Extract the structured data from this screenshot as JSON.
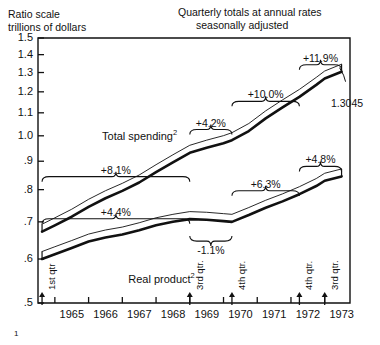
{
  "header": {
    "axis_caption_line1": "Ratio scale",
    "axis_caption_line2": "trillions of dollars",
    "title_line1": "Quarterly totals at annual rates",
    "title_line2": "seasonally adjusted"
  },
  "footnote_marker": "1",
  "chart_data": {
    "type": "line",
    "title": "Quarterly totals at annual rates seasonally adjusted",
    "subtitle": "",
    "xlabel": "",
    "ylabel": "Ratio scale trillions of dollars",
    "scale": "log",
    "grid": false,
    "legend_position": "inline-labels",
    "ylim": [
      0.5,
      1.5
    ],
    "ytick_labels": [
      "1.5",
      "1.4",
      "1.3",
      "1.2",
      "1.1",
      "1.0",
      ".9",
      ".8",
      ".7",
      ".6",
      ".5"
    ],
    "ytick_values": [
      1.5,
      1.4,
      1.3,
      1.2,
      1.1,
      1.0,
      0.9,
      0.8,
      0.7,
      0.6,
      0.5
    ],
    "xtick_labels": [
      "1965",
      "1966",
      "1967",
      "1968",
      "1969",
      "1970",
      "1971",
      "1972",
      "1973"
    ],
    "xtick_values": [
      1965,
      1966,
      1967,
      1968,
      1969,
      1970,
      1971,
      1972,
      1973
    ],
    "xlim": [
      1964.5,
      1973.75
    ],
    "quarter_markers": [
      {
        "label": "1st qtr",
        "x": 1964.62
      },
      {
        "label": "3rd qtr.",
        "x": 1969.0
      },
      {
        "label": "4th qtr.",
        "x": 1970.25
      },
      {
        "label": "4th qtr.",
        "x": 1972.25
      },
      {
        "label": "3rd qtr.",
        "x": 1973.0
      }
    ],
    "series": [
      {
        "name": "Total spending",
        "name_superscript": "2",
        "values": [
          {
            "x": 1964.62,
            "y": 0.672
          },
          {
            "x": 1965.0,
            "y": 0.69
          },
          {
            "x": 1965.5,
            "y": 0.715
          },
          {
            "x": 1966.0,
            "y": 0.745
          },
          {
            "x": 1966.5,
            "y": 0.772
          },
          {
            "x": 1967.0,
            "y": 0.796
          },
          {
            "x": 1967.5,
            "y": 0.824
          },
          {
            "x": 1968.0,
            "y": 0.86
          },
          {
            "x": 1968.5,
            "y": 0.896
          },
          {
            "x": 1969.0,
            "y": 0.932
          },
          {
            "x": 1969.5,
            "y": 0.952
          },
          {
            "x": 1970.0,
            "y": 0.97
          },
          {
            "x": 1970.25,
            "y": 0.982
          },
          {
            "x": 1970.75,
            "y": 1.02
          },
          {
            "x": 1971.25,
            "y": 1.075
          },
          {
            "x": 1971.75,
            "y": 1.125
          },
          {
            "x": 1972.25,
            "y": 1.175
          },
          {
            "x": 1972.75,
            "y": 1.235
          },
          {
            "x": 1973.0,
            "y": 1.268
          },
          {
            "x": 1973.5,
            "y": 1.3045
          }
        ],
        "endpoint_label": "1.3045",
        "growth_annotations": [
          {
            "label": "+8.1%",
            "from_x": 1964.62,
            "to_x": 1969.0
          },
          {
            "label": "+4.2%",
            "from_x": 1969.0,
            "to_x": 1970.25
          },
          {
            "label": "+10.0%",
            "from_x": 1970.25,
            "to_x": 1972.25
          },
          {
            "label": "+11.9%",
            "from_x": 1972.25,
            "to_x": 1973.5
          }
        ]
      },
      {
        "name": "Real product",
        "name_superscript": "2",
        "values": [
          {
            "x": 1964.62,
            "y": 0.6
          },
          {
            "x": 1965.0,
            "y": 0.612
          },
          {
            "x": 1965.5,
            "y": 0.628
          },
          {
            "x": 1966.0,
            "y": 0.645
          },
          {
            "x": 1966.5,
            "y": 0.656
          },
          {
            "x": 1967.0,
            "y": 0.664
          },
          {
            "x": 1967.5,
            "y": 0.676
          },
          {
            "x": 1968.0,
            "y": 0.69
          },
          {
            "x": 1968.5,
            "y": 0.7
          },
          {
            "x": 1969.0,
            "y": 0.708
          },
          {
            "x": 1969.5,
            "y": 0.706
          },
          {
            "x": 1970.0,
            "y": 0.702
          },
          {
            "x": 1970.25,
            "y": 0.7
          },
          {
            "x": 1970.75,
            "y": 0.72
          },
          {
            "x": 1971.25,
            "y": 0.742
          },
          {
            "x": 1971.75,
            "y": 0.762
          },
          {
            "x": 1972.25,
            "y": 0.785
          },
          {
            "x": 1972.75,
            "y": 0.812
          },
          {
            "x": 1973.0,
            "y": 0.83
          },
          {
            "x": 1973.5,
            "y": 0.845
          }
        ],
        "growth_annotations": [
          {
            "label": "+4.4%",
            "from_x": 1964.62,
            "to_x": 1969.0
          },
          {
            "label": "-1.1%",
            "from_x": 1969.0,
            "to_x": 1970.25
          },
          {
            "label": "+6.3%",
            "from_x": 1970.25,
            "to_x": 1972.25
          },
          {
            "label": "+4.8%",
            "from_x": 1972.25,
            "to_x": 1973.5
          }
        ]
      }
    ]
  }
}
